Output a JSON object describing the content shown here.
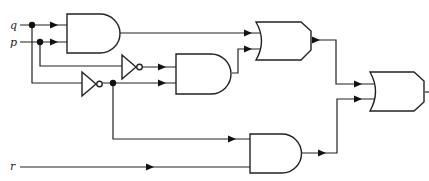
{
  "diagram": {
    "type": "logic-circuit",
    "inputs": [
      {
        "id": "q",
        "label": "q"
      },
      {
        "id": "p",
        "label": "p"
      },
      {
        "id": "r",
        "label": "r"
      }
    ],
    "gates": [
      {
        "id": "and1",
        "type": "AND",
        "inputs": [
          "q",
          "p"
        ]
      },
      {
        "id": "not_p",
        "type": "NOT",
        "inputs": [
          "p"
        ]
      },
      {
        "id": "not_q",
        "type": "NOT",
        "inputs": [
          "q"
        ]
      },
      {
        "id": "and2",
        "type": "AND",
        "inputs": [
          "not_p",
          "not_q"
        ]
      },
      {
        "id": "or1",
        "type": "OR",
        "inputs": [
          "and1",
          "and2"
        ]
      },
      {
        "id": "and3",
        "type": "AND",
        "inputs": [
          "not_q",
          "r"
        ]
      },
      {
        "id": "or2",
        "type": "OR",
        "inputs": [
          "or1",
          "and3"
        ]
      }
    ],
    "output": "or2"
  },
  "labels": {
    "q": "q",
    "p": "p",
    "r": "r"
  }
}
